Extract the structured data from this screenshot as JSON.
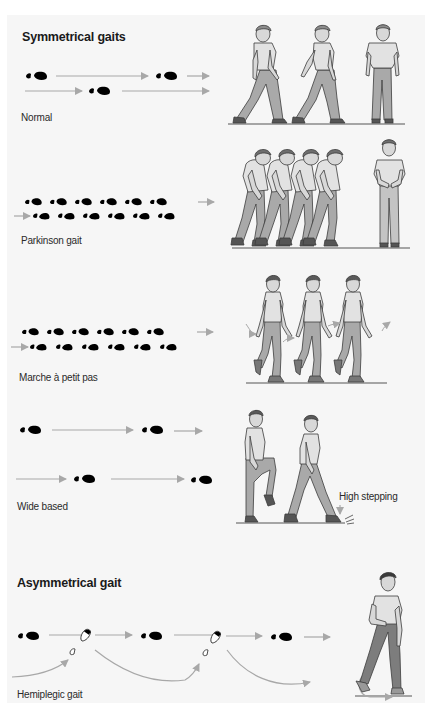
{
  "headings": {
    "symmetrical": "Symmetrical gaits",
    "asymmetrical": "Asymmetrical gait"
  },
  "gaits": [
    {
      "id": "normal",
      "label": "Normal",
      "group": "symmetrical",
      "pattern": "regular long strides, alternating left/right footprints"
    },
    {
      "id": "parkinson",
      "label": "Parkinson gait",
      "group": "symmetrical",
      "pattern": "many short shuffling steps, stooped posture"
    },
    {
      "id": "marche-a-petit-pas",
      "label": "Marche à petit pas",
      "group": "symmetrical",
      "pattern": "many short steps, upright posture"
    },
    {
      "id": "wide-based",
      "label": "Wide based",
      "group": "symmetrical",
      "pattern": "wide lateral spacing between footprints",
      "annotation": "High stepping"
    },
    {
      "id": "hemiplegic",
      "label": "Hemiplegic gait",
      "group": "asymmetrical",
      "pattern": "circumduction of affected leg, curved arrows"
    }
  ],
  "colors": {
    "background": "#ffffff",
    "panel": "#f6f6f6",
    "footprint": "#000000",
    "arrow": "#a8a8a8",
    "shirt": "#e2e2e2",
    "trousers": "#a9a9a9",
    "trousers_dark": "#7d7d7d",
    "hair": "#6e6e6e",
    "skin": "#d8d8d8",
    "shoe": "#555555",
    "outline": "#3c3c3c",
    "text": "#222222"
  }
}
